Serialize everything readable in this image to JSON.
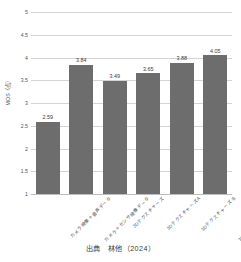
{
  "chart_data": {
    "type": "bar",
    "title": "",
    "xlabel": "",
    "ylabel": "MOS（点）",
    "ylim": [
      1,
      5
    ],
    "yticks": [
      "1",
      "1.5",
      "2",
      "2.5",
      "3",
      "3.5",
      "4",
      "4.5",
      "5"
    ],
    "grid": true,
    "legend": "none",
    "bar_color": "#6d6d6d",
    "categories": [
      "カメラ映像＋音声データ",
      "カメラ＋センサ映像データ",
      "3Dテクスチャーズ",
      "3DテクスチャーズA",
      "3Dテクスチャーズ B",
      "3DテクスチャーズA＋HMD"
    ],
    "values": [
      2.59,
      3.84,
      3.49,
      3.65,
      3.88,
      4.05
    ],
    "value_labels": [
      "2.59",
      "3.84",
      "3.49",
      "3.65",
      "3.88",
      "4.05"
    ]
  },
  "caption": {
    "text": "出典　林他（2024）"
  }
}
